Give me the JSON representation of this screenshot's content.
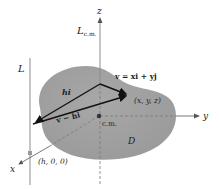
{
  "diagram": {
    "axes": {
      "z": "z",
      "y": "y",
      "x": "x"
    },
    "lines": {
      "L": "L",
      "L_cm_main": "L",
      "L_cm_sub": "c.m."
    },
    "vectors": {
      "hi": "hi",
      "v_main": "v = xi + yj",
      "v_minus_hi": "v − hi"
    },
    "points": {
      "xyz": "(x, y, z)",
      "cm": "c.m.",
      "h00": "(h, 0, 0)"
    },
    "region": "D",
    "colors": {
      "region_fill": "#a3a3a3",
      "axis": "#8c8c8c",
      "vector": "#111111",
      "text": "#222222"
    }
  }
}
